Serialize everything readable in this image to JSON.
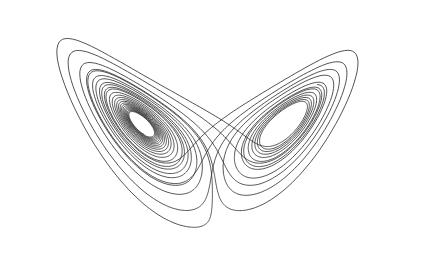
{
  "figure": {
    "background": "#ffffff",
    "stroke_color": "#1a1a1a",
    "stroke_width": 0.75
  },
  "attractor": {
    "sigma": 10,
    "rho": 28,
    "beta": 2.6667,
    "dt": 0.005,
    "steps": 5200,
    "initial": [
      1.0,
      1.0,
      1.0
    ],
    "transient": 400,
    "projection": "x-z, tilted",
    "view": {
      "mirror_x": true,
      "scale_x": 9.0,
      "scale_y": 4.6,
      "offset_x": 213,
      "offset_y": 248,
      "shear": -0.55,
      "y_from": "z",
      "x_from": "x"
    },
    "lobes": [
      {
        "name": "left-lobe",
        "approx_center": [
          95,
          110
        ],
        "approx_extent": {
          "left": 17,
          "top": 36,
          "bottom": 205
        }
      },
      {
        "name": "right-lobe",
        "approx_center": [
          300,
          100
        ],
        "approx_extent": {
          "right": 410,
          "top": 12,
          "bottom": 240
        }
      }
    ]
  }
}
